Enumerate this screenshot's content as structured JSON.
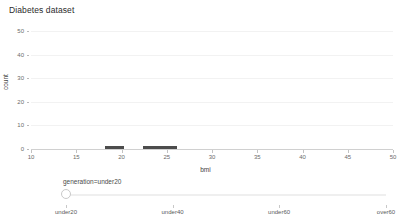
{
  "chart_data": {
    "type": "bar",
    "title": "Diabetes dataset",
    "xlabel": "bmi",
    "ylabel": "count",
    "xlim": [
      10,
      50
    ],
    "ylim": [
      0,
      50
    ],
    "grid": true,
    "legend": "none",
    "x_ticks": [
      "10",
      "15",
      "20",
      "25",
      "30",
      "35",
      "40",
      "45",
      "50"
    ],
    "x_tick_values": [
      10,
      15,
      20,
      25,
      30,
      35,
      40,
      45,
      50
    ],
    "y_ticks": [
      "0",
      "10",
      "20",
      "30",
      "40",
      "50"
    ],
    "y_tick_values": [
      0,
      10,
      20,
      30,
      40,
      50
    ],
    "bar_color": "#4c4c4c",
    "bins": [
      {
        "x0": 18.2,
        "x1": 20.3,
        "value": 1
      },
      {
        "x0": 22.4,
        "x1": 26.1,
        "value": 1
      }
    ]
  },
  "chart": {
    "title": "Diabetes dataset",
    "x_axis_title": "bmi",
    "y_axis_title": "count"
  },
  "slider": {
    "label": "generation=under20",
    "value": "under20",
    "handle_position_pct": 0,
    "ticks": [
      {
        "label": "under20",
        "pos_pct": 0
      },
      {
        "label": "under40",
        "pos_pct": 33.3
      },
      {
        "label": "under60",
        "pos_pct": 66.6
      },
      {
        "label": "over60",
        "pos_pct": 100
      }
    ]
  }
}
